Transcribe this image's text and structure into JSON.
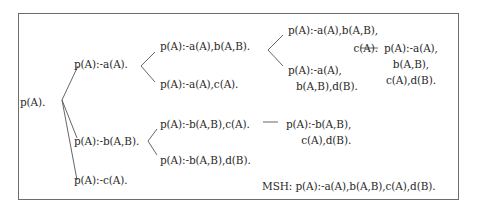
{
  "diagram": {
    "type": "refinement-graph",
    "nodes": {
      "root": {
        "lines": [
          "p(A)."
        ]
      },
      "a": {
        "lines": [
          "p(A):-a(A)."
        ]
      },
      "ab": {
        "lines": [
          "p(A):-a(A),b(A,B)."
        ]
      },
      "ac": {
        "lines": [
          "p(A):-a(A),c(A)."
        ]
      },
      "abc": {
        "lines": [
          "p(A):-a(A),b(A,B),",
          "c(A)."
        ]
      },
      "abd": {
        "lines": [
          "p(A):-a(A),",
          "b(A,B),d(B)."
        ]
      },
      "abcd": {
        "lines": [
          "p(A):-a(A),",
          "b(A,B),",
          "c(A),d(B)."
        ]
      },
      "b": {
        "lines": [
          "p(A):-b(A,B)."
        ]
      },
      "bc": {
        "lines": [
          "p(A):-b(A,B),c(A)."
        ]
      },
      "bd": {
        "lines": [
          "p(A):-b(A,B),d(B)."
        ]
      },
      "bcd": {
        "lines": [
          "p(A):-b(A,B),",
          "c(A),d(B)."
        ]
      },
      "c": {
        "lines": [
          "p(A):-c(A)."
        ]
      }
    },
    "edges": [
      [
        "root",
        "a"
      ],
      [
        "root",
        "b"
      ],
      [
        "root",
        "c"
      ],
      [
        "a",
        "ab"
      ],
      [
        "a",
        "ac"
      ],
      [
        "ab",
        "abc"
      ],
      [
        "ab",
        "abd"
      ],
      [
        "abc",
        "abcd"
      ],
      [
        "b",
        "bc"
      ],
      [
        "b",
        "bd"
      ],
      [
        "bc",
        "bcd"
      ]
    ],
    "msh_label": "MSH: p(A):-a(A),b(A,B),c(A),d(B).",
    "colors": {
      "text": "#2a2a2a",
      "lines": "#555555",
      "border": "#6d6d6d"
    }
  }
}
